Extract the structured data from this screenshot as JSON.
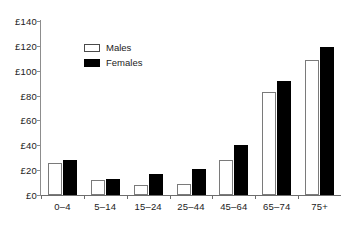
{
  "chart_data": {
    "type": "bar",
    "title": "",
    "subtitle": "",
    "xlabel": "",
    "ylabel": "",
    "categories": [
      "0–4",
      "5–14",
      "15–24",
      "25–44",
      "45–64",
      "65–74",
      "75+"
    ],
    "series": [
      {
        "name": "Males",
        "color": "#ffffff",
        "values": [
          26,
          12,
          8,
          9,
          28,
          83,
          109
        ]
      },
      {
        "name": "Females",
        "color": "#000000",
        "values": [
          28,
          13,
          17,
          21,
          40,
          92,
          119
        ]
      }
    ],
    "ylim": [
      0,
      140
    ],
    "ytick_values": [
      0,
      20,
      40,
      60,
      80,
      100,
      120,
      140
    ],
    "ytick_labels": [
      "£0",
      "£20",
      "£40",
      "£60",
      "£80",
      "£100",
      "£120",
      "£140"
    ],
    "currency_symbol": "£",
    "grid": false,
    "legend_position": "upper-left-inside",
    "legend_entries": [
      "Males",
      "Females"
    ]
  },
  "legend": {
    "males_label": "Males",
    "females_label": "Females"
  }
}
